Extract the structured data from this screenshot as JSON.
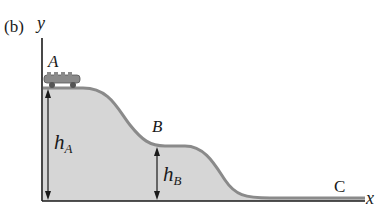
{
  "figure": {
    "panel_label": "(b)",
    "axes": {
      "x_label": "x",
      "y_label": "y"
    },
    "points": [
      {
        "id": "A",
        "label": "A"
      },
      {
        "id": "B",
        "label": "B"
      },
      {
        "id": "C",
        "label": "C"
      }
    ],
    "heights": [
      {
        "id": "hA",
        "symbol": "h",
        "subscript": "A"
      },
      {
        "id": "hB",
        "symbol": "h",
        "subscript": "B"
      }
    ],
    "colors": {
      "fill": "#d6d6d6",
      "track": "#8a8a8a",
      "axis": "#1a1a1a",
      "car": "#7a7a7a"
    }
  }
}
